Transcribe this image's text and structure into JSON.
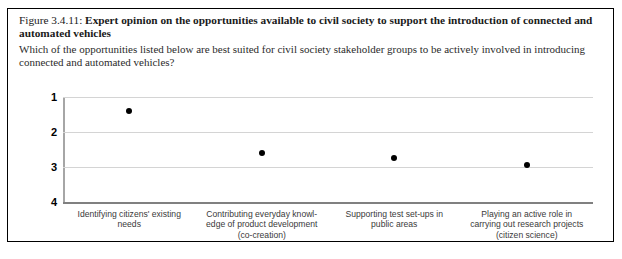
{
  "figure": {
    "number": "Figure 3.4.11:",
    "title": "Expert opinion on the opportunities available to civil society to support the introduction of connected and automated vehicles",
    "question": "Which of the opportunities listed below are best suited for civil society stakeholder groups to be actively involved in introducing connected and automated vehicles?"
  },
  "footer": {
    "note": ""
  },
  "chart_data": {
    "type": "scatter",
    "title": "Expert opinion on the opportunities available to civil society to support the introduction of connected and automated vehicles",
    "subtitle": "Which of the opportunities listed below are best suited for civil society stakeholder groups to be actively involved in introducing connected and automated vehicles?",
    "xlabel": "",
    "ylabel": "",
    "ylim": [
      1,
      4
    ],
    "y_inverted": true,
    "grid": true,
    "legend": false,
    "yticks": [
      "1",
      "2",
      "3",
      "4"
    ],
    "ytick_values": [
      1,
      2,
      3,
      4
    ],
    "categories": [
      "Identifying citizens' existing needs",
      "Contributing everyday knowl-edge of product development (co-creation)",
      "Supporting test set-ups in public areas",
      "Playing an active role in carrying out research projects (citizen science)"
    ],
    "category_lines": [
      [
        "Identifying citizens' existing",
        "needs"
      ],
      [
        "Contributing everyday knowl-",
        "edge of product development",
        "(co-creation)"
      ],
      [
        "Supporting test set-ups in",
        "public areas"
      ],
      [
        "Playing an active role in",
        "carrying out research projects",
        "(citizen science)"
      ]
    ],
    "values": [
      1.4,
      2.6,
      2.75,
      2.95
    ],
    "marker": "circle",
    "marker_color": "#000000"
  },
  "colors": {
    "border": "#000000",
    "gridline": "#d4d4d4",
    "axis": "#a6a6a6",
    "marker": "#000000",
    "tick_text": "#000000",
    "label_text": "#3a3a3a"
  }
}
